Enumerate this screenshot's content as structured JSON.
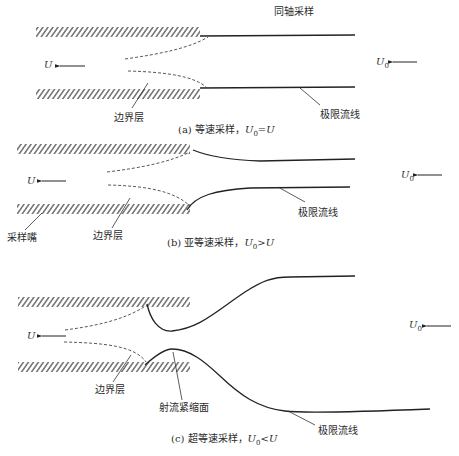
{
  "figure": {
    "panels": [
      {
        "id": "a",
        "top_label": "同轴采样",
        "boundary_layer_label": "边界层",
        "limit_streamline_label": "极限流线",
        "caption_prefix": "(a) 等速采样，",
        "caption_relation": "=",
        "inlet_velocity_symbol": "U",
        "free_velocity_symbol": "U",
        "free_velocity_subscript": "0"
      },
      {
        "id": "b",
        "nozzle_label": "采样嘴",
        "boundary_layer_label": "边界层",
        "limit_streamline_label": "极限流线",
        "caption_prefix": "(b) 亚等速采样，",
        "caption_relation": ">",
        "inlet_velocity_symbol": "U",
        "free_velocity_symbol": "U",
        "free_velocity_subscript": "0"
      },
      {
        "id": "c",
        "boundary_layer_label": "边界层",
        "vena_contracta_label": "射流紧缩面",
        "limit_streamline_label": "极限流线",
        "caption_prefix": "(c) 超等速采样，",
        "caption_relation": "<",
        "inlet_velocity_symbol": "U",
        "free_velocity_symbol": "U",
        "free_velocity_subscript": "0"
      }
    ],
    "colors": {
      "line": "#222222",
      "hatch": "#333333",
      "dashed": "#444444"
    }
  }
}
